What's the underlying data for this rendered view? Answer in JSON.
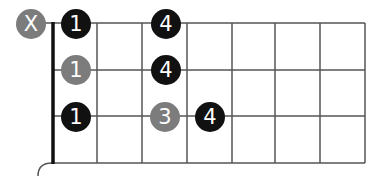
{
  "diagram": {
    "title": "",
    "strings": 4,
    "frets_shown": 7,
    "colors": {
      "line": "#555555",
      "nut": "#111111",
      "primary_dot": "#111111",
      "secondary_dot": "#7c7c7c",
      "dot_text": "#ffffff"
    },
    "muted": [
      {
        "row": 0,
        "label": "X"
      }
    ],
    "fingers": [
      {
        "row": 0,
        "fret": 1,
        "label": "1",
        "color": "black"
      },
      {
        "row": 0,
        "fret": 3,
        "label": "4",
        "color": "black"
      },
      {
        "row": 1,
        "fret": 1,
        "label": "1",
        "color": "gray"
      },
      {
        "row": 1,
        "fret": 3,
        "label": "4",
        "color": "black"
      },
      {
        "row": 2,
        "fret": 1,
        "label": "1",
        "color": "black"
      },
      {
        "row": 2,
        "fret": 3,
        "label": "3",
        "color": "gray"
      },
      {
        "row": 2,
        "fret": 4,
        "label": "4",
        "color": "black"
      }
    ]
  }
}
